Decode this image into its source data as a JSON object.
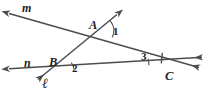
{
  "figure": {
    "type": "geometry-diagram",
    "background_color": "#ffffff",
    "stroke_color": "#4d4d4f",
    "label_color": "#231f20",
    "line_labels": [
      {
        "id": "line-m",
        "text": "m",
        "x": 22,
        "y": 3
      },
      {
        "id": "line-n",
        "text": "n",
        "x": 24,
        "y": 57
      },
      {
        "id": "line-l",
        "text": "ℓ",
        "x": 42,
        "y": 78
      }
    ],
    "point_labels": [
      {
        "id": "point-A",
        "text": "A",
        "x": 90,
        "y": 19
      },
      {
        "id": "point-B",
        "text": "B",
        "x": 50,
        "y": 56
      },
      {
        "id": "point-C",
        "text": "C",
        "x": 166,
        "y": 72
      }
    ],
    "angle_labels": [
      {
        "id": "angle-1",
        "text": "1",
        "x": 110,
        "y": 26
      },
      {
        "id": "angle-2",
        "text": "2",
        "x": 70,
        "y": 63
      },
      {
        "id": "angle-3",
        "text": "3",
        "x": 140,
        "y": 52
      }
    ],
    "lines": [
      {
        "id": "line-m",
        "name": "m",
        "from": {
          "x": 5,
          "y": 12
        },
        "to": {
          "x": 203,
          "y": 69
        },
        "arrow_start": true,
        "arrow_end": true
      },
      {
        "id": "line-l",
        "name": "ℓ",
        "from": {
          "x": 121,
          "y": 11
        },
        "to": {
          "x": 34,
          "y": 83
        },
        "arrow_start": true,
        "arrow_end": true
      },
      {
        "id": "line-n",
        "name": "n",
        "from": {
          "x": 5,
          "y": 69
        },
        "to": {
          "x": 206,
          "y": 57
        },
        "arrow_start": true,
        "arrow_end": true
      }
    ],
    "intersections": [
      {
        "id": "A",
        "x": 97,
        "y": 33,
        "lines": [
          "m",
          "ℓ"
        ]
      },
      {
        "id": "B",
        "x": 62,
        "y": 70,
        "lines": [
          "n",
          "ℓ"
        ]
      },
      {
        "id": "C",
        "x": 172,
        "y": 64,
        "lines": [
          "m",
          "n"
        ]
      }
    ],
    "marks": [
      {
        "id": "tick-angle-3",
        "type": "congruence-tick",
        "x": 162,
        "y": 57
      }
    ]
  }
}
